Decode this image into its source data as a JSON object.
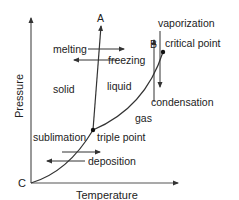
{
  "diagram": {
    "type": "phase-diagram",
    "axes": {
      "x_label": "Temperature",
      "y_label": "Pressure",
      "origin_label": "C"
    },
    "points": {
      "a_label": "A",
      "b_label": "B",
      "triple_point": "triple point",
      "critical_point": "critical point"
    },
    "regions": {
      "solid": "solid",
      "liquid": "liquid",
      "gas": "gas"
    },
    "transitions": {
      "melting": "melting",
      "freezing": "freezing",
      "vaporization": "vaporization",
      "condensation": "condensation",
      "sublimation": "sublimation",
      "deposition": "deposition"
    },
    "colors": {
      "line": "#333333",
      "text": "#222222",
      "background": "#ffffff"
    }
  }
}
